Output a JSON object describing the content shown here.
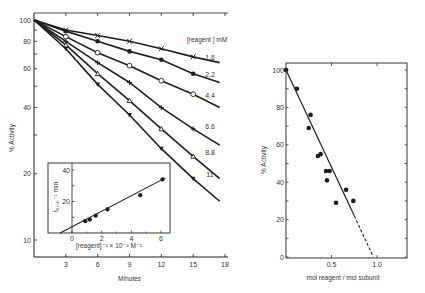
{
  "chart_data": [
    {
      "type": "line",
      "title": "",
      "xlabel": "Minutes",
      "ylabel": "% Activity",
      "yscale": "log",
      "xlim": [
        0,
        18
      ],
      "ylim": [
        10,
        100
      ],
      "xticks": [
        3,
        6,
        9,
        12,
        15,
        18
      ],
      "yticks": [
        10,
        20,
        40,
        60,
        80,
        100
      ],
      "legend_title": "[reagent] mM",
      "series": [
        {
          "name": "1.6",
          "marker": "x",
          "x": [
            0,
            3,
            6,
            9,
            12,
            15,
            17.5
          ],
          "y": [
            100,
            90,
            85,
            80,
            74,
            68,
            64
          ]
        },
        {
          "name": "2.2",
          "marker": "filled-circle",
          "x": [
            0,
            3,
            6,
            9,
            12,
            15,
            17.5
          ],
          "y": [
            100,
            89,
            80,
            72,
            66,
            57,
            52
          ]
        },
        {
          "name": "4.4",
          "marker": "open-circle",
          "x": [
            0,
            3,
            6,
            9,
            12,
            15,
            17.5
          ],
          "y": [
            100,
            84,
            71,
            62,
            53,
            46,
            40
          ]
        },
        {
          "name": "6.6",
          "marker": "plus",
          "x": [
            0,
            3,
            6,
            9,
            12,
            15,
            17.5
          ],
          "y": [
            100,
            80,
            64,
            52,
            40,
            32,
            27
          ]
        },
        {
          "name": "8.8",
          "marker": "open-triangle",
          "x": [
            0,
            3,
            6,
            9,
            12,
            15,
            17.5
          ],
          "y": [
            100,
            77,
            57,
            43,
            32,
            24,
            19
          ]
        },
        {
          "name": "11",
          "marker": "filled-triangle",
          "x": [
            0,
            3,
            6,
            9,
            12,
            15,
            17.5
          ],
          "y": [
            100,
            74,
            51,
            37,
            26,
            19,
            15
          ]
        }
      ],
      "line_labels": [
        "1.6",
        "2.2",
        "4.4",
        "6.6",
        "8.8",
        "11"
      ]
    },
    {
      "type": "scatter",
      "title": "inset",
      "xlabel": "[reagent]⁻¹ × 10⁻² M⁻¹",
      "ylabel": "t₀.₅₀⁻¹ min",
      "xlim": [
        -1,
        6.5
      ],
      "ylim": [
        0,
        45
      ],
      "xticks": [
        0,
        2,
        4,
        6
      ],
      "yticks": [
        20,
        40
      ],
      "points": [
        {
          "x": 0.9,
          "y": 7.5
        },
        {
          "x": 1.2,
          "y": 8.5
        },
        {
          "x": 1.6,
          "y": 11
        },
        {
          "x": 2.4,
          "y": 15
        },
        {
          "x": 4.6,
          "y": 24
        },
        {
          "x": 6.1,
          "y": 34
        }
      ],
      "fit_line": {
        "x": [
          -0.8,
          6.3
        ],
        "y": [
          0,
          35
        ]
      }
    },
    {
      "type": "scatter",
      "title": "",
      "xlabel": "mol reagent / mol subunit",
      "ylabel": "% Activity",
      "xlim": [
        0,
        1.3
      ],
      "ylim": [
        0,
        100
      ],
      "xticks": [
        0.5,
        1.0
      ],
      "yticks": [
        0,
        20,
        40,
        60,
        80,
        100
      ],
      "points": [
        {
          "x": 0.0,
          "y": 100
        },
        {
          "x": 0.12,
          "y": 90
        },
        {
          "x": 0.27,
          "y": 76
        },
        {
          "x": 0.25,
          "y": 69
        },
        {
          "x": 0.35,
          "y": 54
        },
        {
          "x": 0.38,
          "y": 55
        },
        {
          "x": 0.44,
          "y": 46
        },
        {
          "x": 0.48,
          "y": 46
        },
        {
          "x": 0.45,
          "y": 41
        },
        {
          "x": 0.55,
          "y": 29
        },
        {
          "x": 0.66,
          "y": 36
        },
        {
          "x": 0.74,
          "y": 30
        }
      ],
      "fit_line": {
        "x": [
          0,
          0.75
        ],
        "y": [
          100,
          22
        ]
      },
      "extrapolated_line": {
        "x": [
          0.75,
          0.96
        ],
        "y": [
          22,
          0
        ]
      }
    }
  ],
  "labels": {
    "main_xlabel": "Minutes",
    "main_ylabel": "% Activity",
    "legend_title": "[reagent ] mM",
    "inset_xlabel": "[reagent]⁻¹ × 10⁻² M⁻¹",
    "inset_ylabel": "t₀.₅₀⁻¹ min",
    "right_xlabel": "mol reagent / mol subunit",
    "right_ylabel": "% Activity"
  }
}
